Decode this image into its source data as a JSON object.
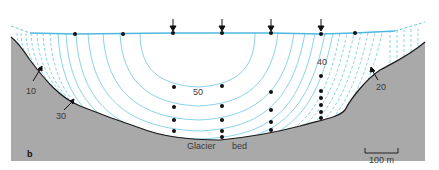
{
  "figure": {
    "panel_label": "b",
    "bed_label_left": "Glacier",
    "bed_label_right": "bed",
    "scale_bar_label": "100 m",
    "contour_labels": [
      {
        "text": "10",
        "x": 28,
        "y": 85
      },
      {
        "text": "30",
        "x": 58,
        "y": 114
      },
      {
        "text": "50",
        "x": 193,
        "y": 89
      },
      {
        "text": "40",
        "x": 317,
        "y": 59
      },
      {
        "text": "20",
        "x": 377,
        "y": 84
      }
    ],
    "colors": {
      "contour": "#6cc6e6",
      "surface": "#4fb8e0",
      "bed_fill": "#a8a8a8",
      "bed_line": "#1a1a1a",
      "dot": "#111111"
    },
    "surface_arrows_x": [
      173,
      222,
      271,
      321
    ],
    "surface_dots_x": [
      75,
      123,
      173,
      222,
      271,
      321,
      355
    ],
    "borehole_dots": [
      {
        "x": 174,
        "y": [
          87,
          107,
          120,
          131
        ]
      },
      {
        "x": 222,
        "y": [
          86,
          106,
          120,
          131,
          137
        ]
      },
      {
        "x": 271,
        "y": [
          92,
          110,
          122,
          130
        ]
      },
      {
        "x": 321,
        "y": [
          76,
          91,
          98,
          105,
          112,
          118
        ]
      }
    ]
  }
}
